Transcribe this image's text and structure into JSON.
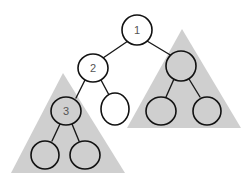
{
  "diagram": {
    "type": "binary-tree",
    "colors": {
      "background": "#ffffff",
      "subtree_fill": "#cfcfcf",
      "node_stroke": "#111111",
      "label": "#555555"
    },
    "nodes": [
      {
        "id": "n1",
        "label": "1",
        "shaded": false
      },
      {
        "id": "n2",
        "label": "2",
        "shaded": false
      },
      {
        "id": "nR",
        "label": "",
        "shaded": true
      },
      {
        "id": "n3",
        "label": "3",
        "shaded": true
      },
      {
        "id": "n2R",
        "label": "",
        "shaded": false
      },
      {
        "id": "nRL",
        "label": "",
        "shaded": true
      },
      {
        "id": "nRR",
        "label": "",
        "shaded": true
      },
      {
        "id": "n3L",
        "label": "",
        "shaded": true
      },
      {
        "id": "n3R",
        "label": "",
        "shaded": true
      }
    ],
    "edges": [
      [
        "n1",
        "n2"
      ],
      [
        "n1",
        "nR"
      ],
      [
        "n2",
        "n3"
      ],
      [
        "n2",
        "n2R"
      ],
      [
        "nR",
        "nRL"
      ],
      [
        "nR",
        "nRR"
      ],
      [
        "n3",
        "n3L"
      ],
      [
        "n3",
        "n3R"
      ]
    ],
    "subtrees": [
      {
        "name": "right-subtree",
        "root": "nR"
      },
      {
        "name": "left-subtree",
        "root": "n3"
      }
    ]
  }
}
